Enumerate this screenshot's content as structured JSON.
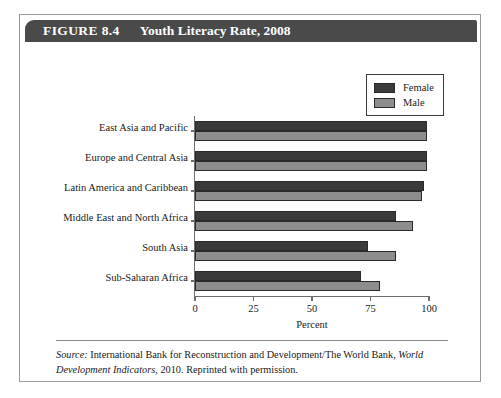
{
  "figure": {
    "label": "FIGURE 8.4",
    "title": "Youth Literacy Rate, 2008"
  },
  "legend": {
    "female_label": "Female",
    "male_label": "Male",
    "female_color": "#3a3a3a",
    "male_color": "#8d8d8d"
  },
  "source": {
    "prefix": "Source:",
    "text_before_italic": " International Bank for Reconstruction and Development/The World Bank, ",
    "italic_title": "World Development Indicators",
    "text_after_italic": ", 2010. Reprinted with permission."
  },
  "chart_data": {
    "type": "bar",
    "orientation": "horizontal",
    "title": "Youth Literacy Rate, 2008",
    "xlabel": "Percent",
    "ylabel": "",
    "xlim": [
      0,
      100
    ],
    "xticks": [
      0,
      25,
      50,
      75,
      100
    ],
    "grid": false,
    "legend_position": "top-right",
    "categories": [
      "East Asia and Pacific",
      "Europe and Central Asia",
      "Latin America and Caribbean",
      "Middle East and North Africa",
      "South Asia",
      "Sub-Saharan Africa"
    ],
    "series": [
      {
        "name": "Female",
        "color": "#3a3a3a",
        "values": [
          99,
          99,
          98,
          86,
          74,
          71
        ]
      },
      {
        "name": "Male",
        "color": "#8d8d8d",
        "values": [
          99,
          99,
          97,
          93,
          86,
          79
        ]
      }
    ]
  }
}
